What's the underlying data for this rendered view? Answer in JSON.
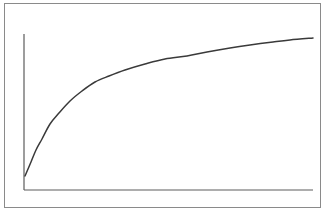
{
  "figure": {
    "title": "",
    "background_color": "#ffffff",
    "frame": {
      "label": "outer frame border",
      "color": "#8a8a8a",
      "x": 4,
      "y": 3,
      "width": 316,
      "height": 204,
      "stroke_width": 1
    },
    "axes": {
      "color": "#5c5c5c",
      "stroke_width": 1.2,
      "y_axis": {
        "x": 24,
        "y_top": 34,
        "y_bottom": 190
      },
      "x_axis": {
        "y": 190,
        "x_left": 24,
        "x_right": 313
      }
    },
    "curve_style": {
      "color": "#3a3a3a",
      "stroke_width": 1.5
    }
  },
  "chart_data": {
    "type": "line",
    "title": "",
    "subtitle": "",
    "xlabel": "",
    "ylabel": "",
    "xlim": [
      0,
      100
    ],
    "ylim": [
      0,
      100
    ],
    "grid": false,
    "legend": null,
    "legend_position": "none",
    "tick_labels_x": [],
    "tick_labels_y": [],
    "annotations": [],
    "series": [
      {
        "name": "curve",
        "color": "#3a3a3a",
        "x": [
          0,
          2,
          4,
          6,
          9,
          12,
          16,
          20,
          25,
          30,
          36,
          43,
          50,
          58,
          65,
          73,
          80,
          88,
          94,
          100
        ],
        "y": [
          9,
          18,
          26,
          33,
          42,
          49,
          57,
          63,
          69,
          73,
          77,
          81,
          84,
          86,
          88,
          90,
          92,
          94,
          96,
          97
        ],
        "pixel_points": [
          [
            25,
            176
          ],
          [
            31,
            162
          ],
          [
            36,
            150
          ],
          [
            42,
            139
          ],
          [
            50,
            124
          ],
          [
            59,
            113
          ],
          [
            70,
            101
          ],
          [
            82,
            91
          ],
          [
            95,
            82
          ],
          [
            109,
            76
          ],
          [
            125,
            70
          ],
          [
            145,
            64
          ],
          [
            165,
            59
          ],
          [
            187,
            56
          ],
          [
            207,
            52
          ],
          [
            230,
            48
          ],
          [
            250,
            45
          ],
          [
            273,
            42
          ],
          [
            290,
            40
          ],
          [
            313,
            38
          ]
        ]
      }
    ]
  },
  "accessibility": {
    "figure_alt": "Line chart showing a saturating curve that rises rapidly from the origin and levels off approaching an asymptote near the top right"
  }
}
